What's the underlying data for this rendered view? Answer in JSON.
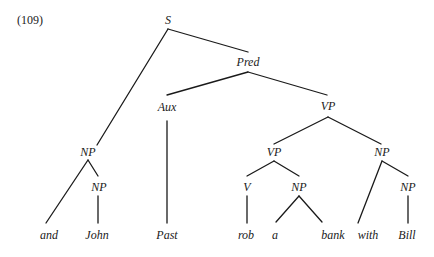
{
  "example_number": "(109)",
  "tree": {
    "nodes": {
      "S": "S",
      "Pred": "Pred",
      "Aux": "Aux",
      "VP_top": "VP",
      "NP_subj": "NP",
      "NP_john": "NP",
      "VP_inner": "VP",
      "NP_pp": "NP",
      "V": "V",
      "NP_obj": "NP",
      "NP_bill": "NP"
    },
    "leaves": {
      "and": "and",
      "John": "John",
      "Past": "Past",
      "rob": "rob",
      "a": "a",
      "bank": "bank",
      "with": "with",
      "Bill": "Bill"
    }
  },
  "colors": {
    "ink": "#1a1a1a",
    "background": "#ffffff"
  }
}
